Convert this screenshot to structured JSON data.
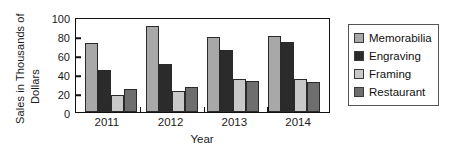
{
  "chart_data": {
    "type": "bar",
    "title": "",
    "xlabel": "Year",
    "ylabel_line1": "Sales in Thousands of",
    "ylabel_line2": "Dollars",
    "categories": [
      "2011",
      "2012",
      "2013",
      "2014"
    ],
    "yticks": [
      "0",
      "20",
      "40",
      "60",
      "80",
      "100"
    ],
    "ylim": [
      0,
      100
    ],
    "grid": false,
    "legend_position": "right",
    "series": [
      {
        "name": "Memorabilia",
        "color": "#a8a8a8",
        "values": [
          73,
          91,
          79,
          80
        ]
      },
      {
        "name": "Engraving",
        "color": "#2b2b2b",
        "values": [
          44,
          51,
          65,
          74
        ]
      },
      {
        "name": "Framing",
        "color": "#c8c8c8",
        "values": [
          18,
          22,
          35,
          35
        ]
      },
      {
        "name": "Restaurant",
        "color": "#6e6e6e",
        "values": [
          24,
          26,
          33,
          32
        ]
      }
    ]
  }
}
